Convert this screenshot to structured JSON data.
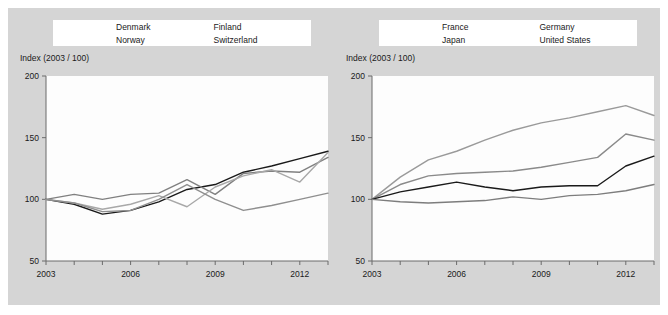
{
  "figure": {
    "background_color": "#d5d5d5",
    "panel_count": 2
  },
  "panels": [
    {
      "id": "left",
      "axis_title": "Index (2003 / 100)",
      "legend": [
        {
          "label": "Denmark"
        },
        {
          "label": "Finland"
        },
        {
          "label": "Norway"
        },
        {
          "label": "Switzerland"
        }
      ],
      "y_ticks": [
        "200",
        "150",
        "100",
        "50"
      ],
      "x_ticks": [
        "2003",
        "2006",
        "2009",
        "2012"
      ]
    },
    {
      "id": "right",
      "axis_title": "Index (2003 / 100)",
      "legend": [
        {
          "label": "France"
        },
        {
          "label": "Germany"
        },
        {
          "label": "Japan"
        },
        {
          "label": "United States"
        }
      ],
      "y_ticks": [
        "200",
        "150",
        "100",
        "50"
      ],
      "x_ticks": [
        "2003",
        "2006",
        "2009",
        "2012"
      ]
    }
  ],
  "chart_data": [
    {
      "type": "line",
      "panel": "left",
      "title": "",
      "subtitle": "",
      "xlabel": "",
      "ylabel": "Index (2003 / 100)",
      "xlim": [
        2003,
        2013
      ],
      "ylim": [
        50,
        200
      ],
      "xticks": [
        2003,
        2006,
        2009,
        2012
      ],
      "xticklabels": [
        "2003",
        "2006",
        "2009",
        "2012"
      ],
      "yticks": [
        50,
        100,
        150,
        200
      ],
      "yticklabels": [
        "50",
        "100",
        "150",
        "200"
      ],
      "minor_xticks": [
        2004,
        2005,
        2007,
        2008,
        2010,
        2011,
        2013
      ],
      "grid": false,
      "legend_position": "top",
      "x": [
        2003,
        2004,
        2005,
        2006,
        2007,
        2008,
        2009,
        2010,
        2011,
        2012,
        2013
      ],
      "series": [
        {
          "name": "Denmark",
          "color": "#1a1a1a",
          "values": [
            100,
            96,
            88,
            91,
            98,
            108,
            112,
            122,
            127,
            133,
            139
          ]
        },
        {
          "name": "Norway",
          "color": "#808080",
          "values": [
            100,
            104,
            100,
            104,
            105,
            116,
            104,
            121,
            123,
            122,
            134
          ]
        },
        {
          "name": "Finland",
          "color": "#a8a8a8",
          "values": [
            100,
            97,
            92,
            96,
            103,
            94,
            110,
            119,
            124,
            114,
            138
          ]
        },
        {
          "name": "Switzerland",
          "color": "#8f8f8f",
          "values": [
            100,
            97,
            90,
            91,
            100,
            112,
            100,
            91,
            95,
            100,
            105
          ]
        }
      ]
    },
    {
      "type": "line",
      "panel": "right",
      "title": "",
      "subtitle": "",
      "xlabel": "",
      "ylabel": "Index (2003 / 100)",
      "xlim": [
        2003,
        2013
      ],
      "ylim": [
        50,
        200
      ],
      "xticks": [
        2003,
        2006,
        2009,
        2012
      ],
      "xticklabels": [
        "2003",
        "2006",
        "2009",
        "2012"
      ],
      "yticks": [
        50,
        100,
        150,
        200
      ],
      "yticklabels": [
        "50",
        "100",
        "150",
        "200"
      ],
      "minor_xticks": [
        2004,
        2005,
        2007,
        2008,
        2010,
        2011,
        2013
      ],
      "grid": false,
      "legend_position": "top",
      "x": [
        2003,
        2004,
        2005,
        2006,
        2007,
        2008,
        2009,
        2010,
        2011,
        2012,
        2013
      ],
      "series": [
        {
          "name": "Germany",
          "color": "#9a9a9a",
          "values": [
            100,
            118,
            132,
            139,
            148,
            156,
            162,
            166,
            171,
            176,
            168
          ]
        },
        {
          "name": "United States",
          "color": "#8a8a8a",
          "values": [
            100,
            112,
            119,
            121,
            122,
            123,
            126,
            130,
            134,
            153,
            148
          ]
        },
        {
          "name": "France",
          "color": "#1a1a1a",
          "values": [
            100,
            106,
            110,
            114,
            110,
            107,
            110,
            111,
            111,
            127,
            135
          ]
        },
        {
          "name": "Japan",
          "color": "#7d7d7d",
          "values": [
            100,
            98,
            97,
            98,
            99,
            102,
            100,
            103,
            104,
            107,
            112
          ]
        }
      ]
    }
  ]
}
